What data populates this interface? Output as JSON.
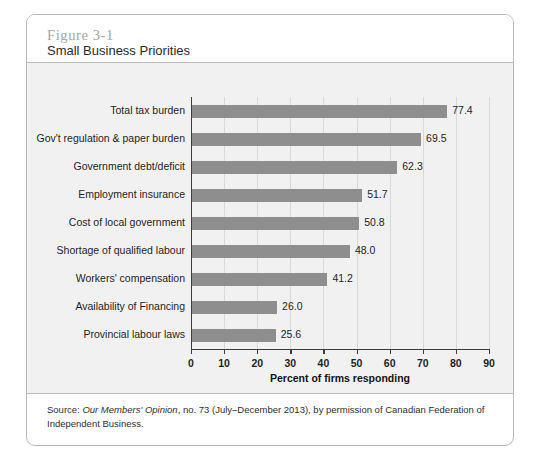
{
  "figure": {
    "number": "Figure 3-1",
    "title": "Small Business Priorities"
  },
  "source_note": {
    "prefix": "Source: ",
    "publication": "Our Members' Opinion",
    "suffix": ", no. 73 (July–December 2013), by permission of Canadian Federation of Independent Business."
  },
  "colors": {
    "bar": "#8e8e8e",
    "panel_background": "#f1f1f1",
    "axis": "#3d3d3d",
    "gridline": "#d8d8d8",
    "figure_number": "#a6a6a6"
  },
  "chart_data": {
    "type": "bar",
    "orientation": "horizontal",
    "title": "Small Business Priorities",
    "xlabel": "Percent of firms responding",
    "ylabel": "",
    "xlim": [
      0,
      90
    ],
    "xticks": [
      0,
      10,
      20,
      30,
      40,
      50,
      60,
      70,
      80,
      90
    ],
    "grid": true,
    "grid_axis": "x",
    "legend": false,
    "categories": [
      "Total tax burden",
      "Gov't regulation & paper burden",
      "Government debt/deficit",
      "Employment insurance",
      "Cost of local government",
      "Shortage of qualified labour",
      "Workers' compensation",
      "Availability of Financing",
      "Provincial labour laws"
    ],
    "values": [
      77.4,
      69.5,
      62.3,
      51.7,
      50.8,
      48.0,
      41.2,
      26.0,
      25.6
    ],
    "value_labels": [
      "77.4",
      "69.5",
      "62.3",
      "51.7",
      "50.8",
      "48.0",
      "41.2",
      "26.0",
      "25.6"
    ]
  }
}
